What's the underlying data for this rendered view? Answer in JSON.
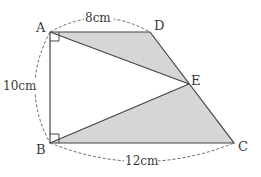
{
  "diagram": {
    "type": "geometry",
    "colors": {
      "stroke": "#444444",
      "fill": "#d6d6d6",
      "dash": "#666666",
      "text": "#3a3a3a"
    },
    "points": {
      "A": {
        "label": "A",
        "x": 50,
        "y": 32
      },
      "D": {
        "label": "D",
        "x": 150,
        "y": 32
      },
      "E": {
        "label": "E",
        "x": 189,
        "y": 84
      },
      "B": {
        "label": "B",
        "x": 50,
        "y": 143
      },
      "C": {
        "label": "C",
        "x": 234,
        "y": 143
      }
    },
    "shaded_regions": [
      "triangle ADE",
      "triangle BEC"
    ],
    "right_angles": [
      "A",
      "B"
    ],
    "dimensions": {
      "AD": "8cm",
      "AB": "10cm",
      "BC": "12cm"
    }
  }
}
